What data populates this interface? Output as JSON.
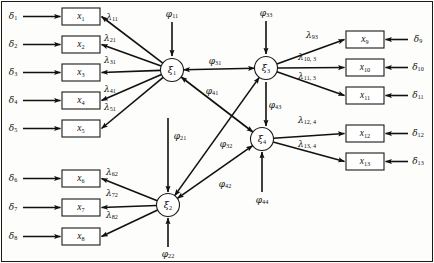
{
  "figure": {
    "type": "structural-equation-model-path-diagram",
    "title": "",
    "frame": {
      "visible": true,
      "color": "#1a1a1a"
    }
  },
  "latent_variables": [
    {
      "id": "xi1",
      "label": "ξ",
      "sub": "1",
      "cx": 172,
      "cy": 70,
      "r": 11.5
    },
    {
      "id": "xi2",
      "label": "ξ",
      "sub": "2",
      "cx": 168,
      "cy": 205,
      "r": 11.5
    },
    {
      "id": "xi3",
      "label": "ξ",
      "sub": "3",
      "cx": 266,
      "cy": 68,
      "r": 11.5
    },
    {
      "id": "xi4",
      "label": "ξ",
      "sub": "4",
      "cx": 262,
      "cy": 139,
      "r": 11.5
    }
  ],
  "observed_variables": [
    {
      "id": "x1",
      "label": "x",
      "sub": "1",
      "x": 62,
      "y": 8,
      "w": 38,
      "h": 17,
      "side": "left"
    },
    {
      "id": "x2",
      "label": "x",
      "sub": "2",
      "x": 62,
      "y": 36,
      "w": 38,
      "h": 17,
      "side": "left"
    },
    {
      "id": "x3",
      "label": "x",
      "sub": "3",
      "x": 62,
      "y": 64,
      "w": 38,
      "h": 17,
      "side": "left"
    },
    {
      "id": "x4",
      "label": "x",
      "sub": "4",
      "x": 62,
      "y": 92,
      "w": 38,
      "h": 17,
      "side": "left"
    },
    {
      "id": "x5",
      "label": "x",
      "sub": "5",
      "x": 62,
      "y": 120,
      "w": 38,
      "h": 17,
      "side": "left"
    },
    {
      "id": "x6",
      "label": "x",
      "sub": "6",
      "x": 62,
      "y": 170,
      "w": 38,
      "h": 17,
      "side": "left"
    },
    {
      "id": "x7",
      "label": "x",
      "sub": "7",
      "x": 62,
      "y": 199,
      "w": 38,
      "h": 17,
      "side": "left"
    },
    {
      "id": "x8",
      "label": "x",
      "sub": "8",
      "x": 62,
      "y": 228,
      "w": 38,
      "h": 17,
      "side": "left"
    },
    {
      "id": "x9",
      "label": "x",
      "sub": "9",
      "x": 346,
      "y": 31,
      "w": 38,
      "h": 17,
      "side": "right"
    },
    {
      "id": "x10",
      "label": "x",
      "sub": "10",
      "x": 346,
      "y": 59,
      "w": 38,
      "h": 17,
      "side": "right"
    },
    {
      "id": "x11",
      "label": "x",
      "sub": "11",
      "x": 346,
      "y": 87,
      "w": 38,
      "h": 17,
      "side": "right"
    },
    {
      "id": "x12",
      "label": "x",
      "sub": "12",
      "x": 346,
      "y": 125,
      "w": 38,
      "h": 17,
      "side": "right"
    },
    {
      "id": "x13",
      "label": "x",
      "sub": "13",
      "x": 346,
      "y": 153,
      "w": 38,
      "h": 17,
      "side": "right"
    }
  ],
  "error_terms": [
    {
      "id": "d1",
      "label": "δ",
      "sub": "1",
      "x": 13,
      "y": 16,
      "target": "x1",
      "side": "left"
    },
    {
      "id": "d2",
      "label": "δ",
      "sub": "2",
      "x": 13,
      "y": 44,
      "target": "x2",
      "side": "left"
    },
    {
      "id": "d3",
      "label": "δ",
      "sub": "3",
      "x": 13,
      "y": 72,
      "target": "x3",
      "side": "left"
    },
    {
      "id": "d4",
      "label": "δ",
      "sub": "4",
      "x": 13,
      "y": 100,
      "target": "x4",
      "side": "left"
    },
    {
      "id": "d5",
      "label": "δ",
      "sub": "5",
      "x": 13,
      "y": 128,
      "target": "x5",
      "side": "left"
    },
    {
      "id": "d6",
      "label": "δ",
      "sub": "6",
      "x": 13,
      "y": 178,
      "target": "x6",
      "side": "left"
    },
    {
      "id": "d7",
      "label": "δ",
      "sub": "7",
      "x": 13,
      "y": 207,
      "target": "x7",
      "side": "left"
    },
    {
      "id": "d8",
      "label": "δ",
      "sub": "8",
      "x": 13,
      "y": 236,
      "target": "x8",
      "side": "left"
    },
    {
      "id": "d9",
      "label": "δ",
      "sub": "9",
      "x": 418,
      "y": 39,
      "target": "x9",
      "side": "right"
    },
    {
      "id": "d10",
      "label": "δ",
      "sub": "10",
      "x": 418,
      "y": 67,
      "target": "x10",
      "side": "right"
    },
    {
      "id": "d11",
      "label": "δ",
      "sub": "11",
      "x": 418,
      "y": 95,
      "target": "x11",
      "side": "right"
    },
    {
      "id": "d12",
      "label": "δ",
      "sub": "12",
      "x": 418,
      "y": 133,
      "target": "x12",
      "side": "right"
    },
    {
      "id": "d13",
      "label": "δ",
      "sub": "13",
      "x": 418,
      "y": 161,
      "target": "x13",
      "side": "right"
    }
  ],
  "loadings": [
    {
      "id": "l11",
      "label": "λ",
      "sub": "11",
      "from": "xi1",
      "to": "x1",
      "lx": 112,
      "ly": 17
    },
    {
      "id": "l21",
      "label": "λ",
      "sub": "21",
      "from": "xi1",
      "to": "x2",
      "lx": 110,
      "ly": 38
    },
    {
      "id": "l31",
      "label": "λ",
      "sub": "31",
      "from": "xi1",
      "to": "x3",
      "lx": 110,
      "ly": 60
    },
    {
      "id": "l41",
      "label": "λ",
      "sub": "41",
      "from": "xi1",
      "to": "x4",
      "lx": 110,
      "ly": 89
    },
    {
      "id": "l51",
      "label": "λ",
      "sub": "51",
      "from": "xi1",
      "to": "x5",
      "lx": 110,
      "ly": 107
    },
    {
      "id": "l62",
      "label": "λ",
      "sub": "62",
      "from": "xi2",
      "to": "x6",
      "lx": 112,
      "ly": 172
    },
    {
      "id": "l72",
      "label": "λ",
      "sub": "72",
      "from": "xi2",
      "to": "x7",
      "lx": 112,
      "ly": 193
    },
    {
      "id": "l82",
      "label": "λ",
      "sub": "82",
      "from": "xi2",
      "to": "x8",
      "lx": 112,
      "ly": 215
    },
    {
      "id": "l93",
      "label": "λ",
      "sub": "93",
      "from": "xi3",
      "to": "x9",
      "lx": 312,
      "ly": 35
    },
    {
      "id": "l103",
      "label": "λ",
      "sub": "10, 3",
      "from": "xi3",
      "to": "x10",
      "lx": 307,
      "ly": 57
    },
    {
      "id": "l113",
      "label": "λ",
      "sub": "11, 3",
      "from": "xi3",
      "to": "x11",
      "lx": 307,
      "ly": 76
    },
    {
      "id": "l124",
      "label": "λ",
      "sub": "12, 4",
      "from": "xi4",
      "to": "x12",
      "lx": 307,
      "ly": 120
    },
    {
      "id": "l134",
      "label": "λ",
      "sub": "13, 4",
      "from": "xi4",
      "to": "x13",
      "lx": 307,
      "ly": 144
    }
  ],
  "variances": [
    {
      "id": "p11",
      "label": "φ",
      "sub": "11",
      "target": "xi1",
      "dir": "down",
      "lx": 172,
      "ly": 14,
      "x": 172,
      "y1": 22,
      "y2": 56
    },
    {
      "id": "p21",
      "label": "φ",
      "sub": "21",
      "target": "xi2",
      "dir": "down",
      "lx": 180,
      "ly": 136,
      "x": 168,
      "y1": 118,
      "y2": 192
    },
    {
      "id": "p22",
      "label": "φ",
      "sub": "22",
      "target": "xi2",
      "dir": "up",
      "lx": 168,
      "ly": 254,
      "x": 168,
      "y1": 247,
      "y2": 218
    },
    {
      "id": "p33",
      "label": "φ",
      "sub": "33",
      "target": "xi3",
      "dir": "down",
      "lx": 266,
      "ly": 13,
      "x": 266,
      "y1": 21,
      "y2": 54
    },
    {
      "id": "p43",
      "label": "φ",
      "sub": "43",
      "target": "xi4",
      "dir": "down",
      "lx": 275,
      "ly": 105,
      "x": 266,
      "y1": 82,
      "y2": 126
    },
    {
      "id": "p44",
      "label": "φ",
      "sub": "44",
      "target": "xi4",
      "dir": "up",
      "lx": 262,
      "ly": 200,
      "x": 262,
      "y1": 192,
      "y2": 152
    }
  ],
  "covariances": [
    {
      "id": "p31",
      "label": "φ",
      "sub": "31",
      "from": "xi1",
      "to": "xi3",
      "lx": 215,
      "ly": 61
    },
    {
      "id": "p41",
      "label": "φ",
      "sub": "41",
      "from": "xi1",
      "to": "xi4",
      "lx": 212,
      "ly": 91
    },
    {
      "id": "p32",
      "label": "φ",
      "sub": "32",
      "from": "xi2",
      "to": "xi3",
      "lx": 226,
      "ly": 144
    },
    {
      "id": "p42",
      "label": "φ",
      "sub": "42",
      "from": "xi2",
      "to": "xi4",
      "lx": 225,
      "ly": 184
    }
  ],
  "colors": {
    "stroke": "#111111",
    "box_fill": "#ffffff",
    "background": "#fdfdfb",
    "frame": "#1a1a1a"
  }
}
